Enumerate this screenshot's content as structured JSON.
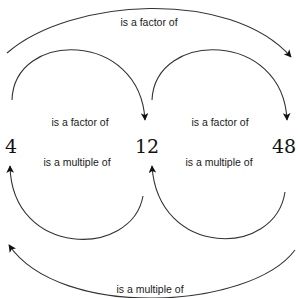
{
  "diagram": {
    "nodes": [
      {
        "id": "n4",
        "label": "4"
      },
      {
        "id": "n12",
        "label": "12"
      },
      {
        "id": "n48",
        "label": "48"
      }
    ],
    "edges": [
      {
        "id": "top",
        "from": "4",
        "to": "48",
        "label": "is a factor of"
      },
      {
        "id": "left_top",
        "from": "4",
        "to": "12",
        "label": "is a factor of"
      },
      {
        "id": "right_top",
        "from": "12",
        "to": "48",
        "label": "is a factor of"
      },
      {
        "id": "left_bottom",
        "from": "12",
        "to": "4",
        "label": "is a multiple of"
      },
      {
        "id": "right_bottom",
        "from": "48",
        "to": "12",
        "label": "is a multiple of"
      },
      {
        "id": "bottom",
        "from": "48",
        "to": "4",
        "label": "is a multiple of"
      }
    ]
  },
  "colors": {
    "line": "#333333",
    "text": "#1a1a1a",
    "background": "#ffffff"
  }
}
